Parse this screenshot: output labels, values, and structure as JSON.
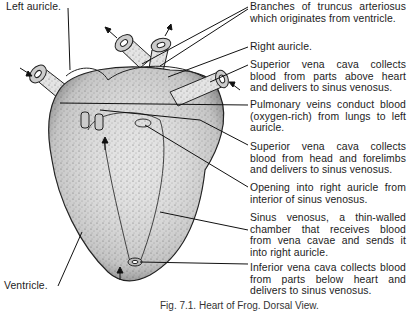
{
  "figure": {
    "caption": "Fig. 7.1. Heart of Frog. Dorsal View.",
    "colors": {
      "ink": "#1c1c1c",
      "tissue": "#d8d8d8",
      "background": "#ffffff"
    }
  },
  "labels": {
    "left_auricle": "Left auricle.",
    "ventricle": "Ventricle.",
    "truncus_branches": "Branches of truncus arteriosus which originates from ventricle.",
    "right_auricle": "Right auricle.",
    "superior_vena_cava_upper": "Superior vena cava collects blood from parts above heart and delivers to sinus venosus.",
    "pulmonary_veins": "Pulmonary veins conduct blood (oxygen-rich) from lungs to left auricle.",
    "superior_vena_cava_head": "Superior vena cava collects blood from head and forelimbs and delivers to sinus venosus.",
    "opening_right_auricle": "Opening into right auricle from interior of sinus venosus.",
    "sinus_venosus": "Sinus venosus, a thin-walled chamber that receives blood from vena cavae and sends it into right auricle.",
    "inferior_vena_cava": "Inferior vena cava collects blood from parts below heart and delivers to sinus venosus."
  }
}
